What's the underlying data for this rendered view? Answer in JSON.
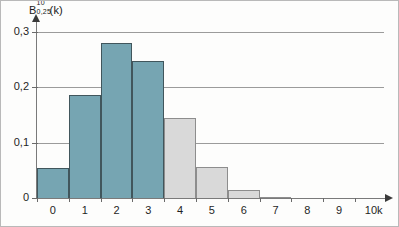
{
  "chart_data": {
    "type": "bar",
    "title_parts": {
      "base": "B",
      "superscript": "10",
      "subscript": "0,25",
      "argument": "(k)"
    },
    "xlabel": "k",
    "ylabel": "",
    "categories": [
      "0",
      "1",
      "2",
      "3",
      "4",
      "5",
      "6",
      "7",
      "8",
      "9",
      "10"
    ],
    "values": [
      0.056,
      0.188,
      0.282,
      0.25,
      0.146,
      0.058,
      0.016,
      0.003,
      0.0004,
      3e-05,
      1e-06
    ],
    "ylim": [
      0,
      0.32
    ],
    "xlim": [
      -0.5,
      10.5
    ],
    "grid": true,
    "legend": "none",
    "y_ticks": [
      "0",
      "0,1",
      "0,2",
      "0,3"
    ],
    "y_tick_values": [
      0,
      0.1,
      0.2,
      0.3
    ],
    "x_ticks": [
      "0",
      "1",
      "2",
      "3",
      "4",
      "5",
      "6",
      "7",
      "8",
      "9",
      "10"
    ],
    "bar_colors": [
      "#76a5b2",
      "#76a5b2",
      "#76a5b2",
      "#76a5b2",
      "#d9d9d9",
      "#d9d9d9",
      "#d9d9d9",
      "#d9d9d9",
      "#d9d9d9",
      "#d9d9d9",
      "#d9d9d9"
    ],
    "accent_color": "#76a5b2",
    "secondary_color": "#d9d9d9",
    "grid_color": "#9b9b9b",
    "axis_color": "#7a7a7a"
  }
}
